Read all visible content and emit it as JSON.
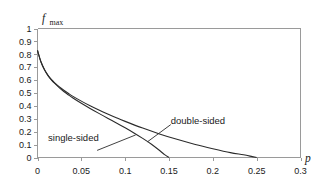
{
  "chart_data": {
    "type": "line",
    "title": "",
    "xlabel": "p",
    "ylabel": "f_max",
    "ylabel_base": "f",
    "ylabel_sub": "max",
    "xlim": [
      0,
      0.3
    ],
    "ylim": [
      0,
      1
    ],
    "grid": false,
    "legend_position": "inline-annotations",
    "xticks": [
      0,
      0.05,
      0.1,
      0.15,
      0.2,
      0.25,
      0.3
    ],
    "xtick_labels": [
      "0",
      "0.05",
      "0.1",
      "0.15",
      "0.2",
      "0.25",
      "0.3"
    ],
    "yticks": [
      0,
      0.1,
      0.2,
      0.3,
      0.4,
      0.5,
      0.6,
      0.7,
      0.8,
      0.9,
      1
    ],
    "ytick_labels": [
      "0",
      "0.1",
      "0.2",
      "0.3",
      "0.4",
      "0.5",
      "0.6",
      "0.7",
      "0.8",
      "0.9",
      "1"
    ],
    "series": [
      {
        "name": "single-sided",
        "color": "#2b2b2b",
        "x": [
          0,
          0.004,
          0.008,
          0.012,
          0.016,
          0.02,
          0.025,
          0.03,
          0.035,
          0.04,
          0.05,
          0.06,
          0.07,
          0.08,
          0.09,
          0.1,
          0.11,
          0.12,
          0.13,
          0.14,
          0.145,
          0.15
        ],
        "y": [
          0.83,
          0.74,
          0.68,
          0.635,
          0.6,
          0.572,
          0.54,
          0.512,
          0.487,
          0.463,
          0.42,
          0.38,
          0.342,
          0.305,
          0.268,
          0.23,
          0.19,
          0.148,
          0.103,
          0.05,
          0.022,
          0.0
        ]
      },
      {
        "name": "double-sided",
        "color": "#2b2b2b",
        "x": [
          0,
          0.004,
          0.008,
          0.012,
          0.016,
          0.02,
          0.025,
          0.03,
          0.035,
          0.04,
          0.05,
          0.06,
          0.07,
          0.08,
          0.09,
          0.1,
          0.12,
          0.14,
          0.16,
          0.18,
          0.2,
          0.22,
          0.235,
          0.245,
          0.25
        ],
        "y": [
          0.83,
          0.74,
          0.68,
          0.637,
          0.603,
          0.577,
          0.547,
          0.521,
          0.498,
          0.476,
          0.437,
          0.402,
          0.369,
          0.338,
          0.308,
          0.28,
          0.228,
          0.181,
          0.139,
          0.101,
          0.068,
          0.038,
          0.021,
          0.007,
          0.0
        ]
      }
    ],
    "annotations": [
      {
        "text": "single-sided",
        "label_x": 0.012,
        "label_y": 0.155,
        "leader_from_x": 0.068,
        "leader_from_y": 0.055,
        "leader_to_x": 0.112,
        "leader_to_y": 0.175
      },
      {
        "text": "double-sided",
        "label_x": 0.152,
        "label_y": 0.285,
        "leader_from_x": 0.152,
        "leader_from_y": 0.255,
        "leader_to_x": 0.1255,
        "leader_to_y": 0.122
      }
    ]
  }
}
